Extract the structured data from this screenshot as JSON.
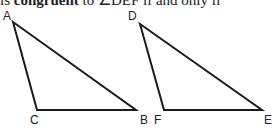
{
  "header_text": {
    "prefix": "is ",
    "bold": "congruent",
    "suffix": " to ∠DEF if and only if"
  },
  "figure": {
    "triangle_1": {
      "name": "ABC",
      "vertices": {
        "A": [
          13,
          22
        ],
        "B": [
          136,
          110
        ],
        "C": [
          37,
          110
        ]
      },
      "labels": {
        "A": "A",
        "B": "B",
        "C": "C"
      }
    },
    "triangle_2": {
      "name": "DEF",
      "vertices": {
        "D": [
          140,
          24
        ],
        "E": [
          262,
          110
        ],
        "F": [
          164,
          110
        ]
      },
      "labels": {
        "D": "D",
        "E": "E",
        "F": "F"
      }
    },
    "stroke_color": "#1a1a1a"
  }
}
